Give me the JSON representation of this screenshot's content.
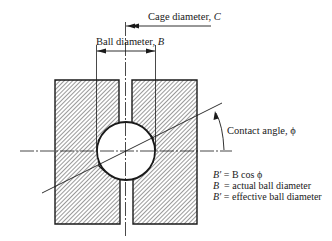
{
  "diagram": {
    "labels": {
      "cage_diameter": "Cage diameter, ",
      "cage_symbol": "C",
      "ball_diameter": "Ball diameter, ",
      "ball_symbol": "B",
      "contact_angle": "Contact angle, ϕ"
    },
    "legend": [
      {
        "symbol": "B′",
        "text": " = B cos ϕ"
      },
      {
        "symbol": "B",
        "text": "  = actual ball diameter"
      },
      {
        "symbol": "B′",
        "text": " = effective ball diameter"
      }
    ],
    "colors": {
      "line": "#1a1a1a",
      "hatch": "#555555",
      "background": "#ffffff"
    }
  }
}
